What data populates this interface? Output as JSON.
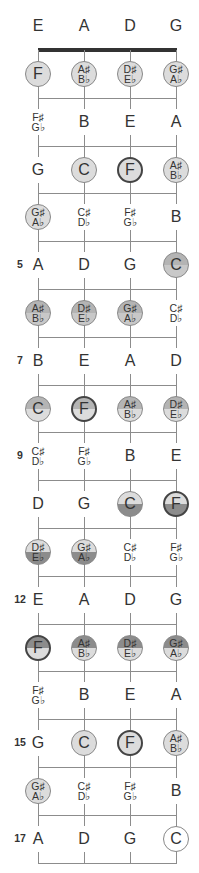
{
  "open_strings": [
    "E",
    "A",
    "D",
    "G"
  ],
  "fret_numbers": [
    {
      "fret": 5,
      "label": "5"
    },
    {
      "fret": 7,
      "label": "7"
    },
    {
      "fret": 9,
      "label": "9"
    },
    {
      "fret": 12,
      "label": "12"
    },
    {
      "fret": 15,
      "label": "15"
    },
    {
      "fret": 17,
      "label": "17"
    }
  ],
  "colors": {
    "light": "#dcdcdc",
    "medium": "#b4b4b4",
    "dark": "#8c8c8c",
    "white": "#ffffff",
    "line": "#8c8c8c",
    "nut": "#333333"
  },
  "frets": [
    {
      "fret": 1,
      "notes": [
        {
          "text": "F",
          "style": "light"
        },
        {
          "text": "A♯\nB♭",
          "style": "light"
        },
        {
          "text": "D♯\nE♭",
          "style": "light"
        },
        {
          "text": "G♯\nA♭",
          "style": "light"
        }
      ]
    },
    {
      "fret": 2,
      "notes": [
        {
          "text": "F♯\nG♭",
          "style": "none"
        },
        {
          "text": "B",
          "style": "none"
        },
        {
          "text": "E",
          "style": "none"
        },
        {
          "text": "A",
          "style": "none"
        }
      ]
    },
    {
      "fret": 3,
      "notes": [
        {
          "text": "G",
          "style": "none"
        },
        {
          "text": "C",
          "style": "light"
        },
        {
          "text": "F",
          "style": "light",
          "bold": true
        },
        {
          "text": "A♯\nB♭",
          "style": "light"
        }
      ]
    },
    {
      "fret": 4,
      "notes": [
        {
          "text": "G♯\nA♭",
          "style": "light"
        },
        {
          "text": "C♯\nD♭",
          "style": "none"
        },
        {
          "text": "F♯\nG♭",
          "style": "none"
        },
        {
          "text": "B",
          "style": "none"
        }
      ]
    },
    {
      "fret": 5,
      "notes": [
        {
          "text": "A",
          "style": "none"
        },
        {
          "text": "D",
          "style": "none"
        },
        {
          "text": "G",
          "style": "none"
        },
        {
          "text": "C",
          "style": "med-light"
        }
      ]
    },
    {
      "fret": 6,
      "notes": [
        {
          "text": "A♯\nB♭",
          "style": "med-light"
        },
        {
          "text": "D♯\nE♭",
          "style": "med-light"
        },
        {
          "text": "G♯\nA♭",
          "style": "med-light"
        },
        {
          "text": "C♯\nD♭",
          "style": "none"
        }
      ]
    },
    {
      "fret": 7,
      "notes": [
        {
          "text": "B",
          "style": "none"
        },
        {
          "text": "E",
          "style": "none"
        },
        {
          "text": "A",
          "style": "none"
        },
        {
          "text": "D",
          "style": "none"
        }
      ]
    },
    {
      "fret": 8,
      "notes": [
        {
          "text": "C",
          "style": "med-top"
        },
        {
          "text": "F",
          "style": "med-top",
          "bold": true
        },
        {
          "text": "A♯\nB♭",
          "style": "med-top"
        },
        {
          "text": "D♯\nE♭",
          "style": "med-top"
        }
      ]
    },
    {
      "fret": 9,
      "notes": [
        {
          "text": "C♯\nD♭",
          "style": "none"
        },
        {
          "text": "F♯\nG♭",
          "style": "none"
        },
        {
          "text": "B",
          "style": "none"
        },
        {
          "text": "E",
          "style": "none"
        }
      ]
    },
    {
      "fret": 10,
      "notes": [
        {
          "text": "D",
          "style": "none"
        },
        {
          "text": "G",
          "style": "none"
        },
        {
          "text": "C",
          "style": "dark-bottom"
        },
        {
          "text": "F",
          "style": "dark-bottom",
          "bold": true
        }
      ]
    },
    {
      "fret": 11,
      "notes": [
        {
          "text": "D♯\nE♭",
          "style": "dark-bottom"
        },
        {
          "text": "G♯\nA♭",
          "style": "dark-bottom"
        },
        {
          "text": "C♯\nD♭",
          "style": "none"
        },
        {
          "text": "F♯\nG♭",
          "style": "none"
        }
      ]
    },
    {
      "fret": 12,
      "notes": [
        {
          "text": "E",
          "style": "none"
        },
        {
          "text": "A",
          "style": "none"
        },
        {
          "text": "D",
          "style": "none"
        },
        {
          "text": "G",
          "style": "none"
        }
      ]
    },
    {
      "fret": 13,
      "notes": [
        {
          "text": "F",
          "style": "dark-top",
          "bold": true
        },
        {
          "text": "A♯\nB♭",
          "style": "dark-top"
        },
        {
          "text": "D♯\nE♭",
          "style": "dark-top"
        },
        {
          "text": "G♯\nA♭",
          "style": "dark-top"
        }
      ]
    },
    {
      "fret": 14,
      "notes": [
        {
          "text": "F♯\nG♭",
          "style": "none"
        },
        {
          "text": "B",
          "style": "none"
        },
        {
          "text": "E",
          "style": "none"
        },
        {
          "text": "A",
          "style": "none"
        }
      ]
    },
    {
      "fret": 15,
      "notes": [
        {
          "text": "G",
          "style": "none"
        },
        {
          "text": "C",
          "style": "light"
        },
        {
          "text": "F",
          "style": "light",
          "bold": true
        },
        {
          "text": "A♯\nB♭",
          "style": "light"
        }
      ]
    },
    {
      "fret": 16,
      "notes": [
        {
          "text": "G♯\nA♭",
          "style": "light"
        },
        {
          "text": "C♯\nD♭",
          "style": "none"
        },
        {
          "text": "F♯\nG♭",
          "style": "none"
        },
        {
          "text": "B",
          "style": "none"
        }
      ]
    },
    {
      "fret": 17,
      "notes": [
        {
          "text": "A",
          "style": "none"
        },
        {
          "text": "D",
          "style": "none"
        },
        {
          "text": "G",
          "style": "none"
        },
        {
          "text": "C",
          "style": "white"
        }
      ]
    }
  ]
}
